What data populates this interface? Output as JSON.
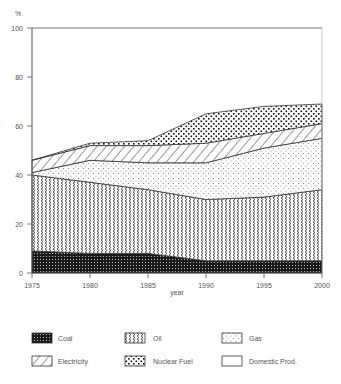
{
  "chart_data": {
    "type": "area",
    "stacked": true,
    "title": "",
    "xlabel": "year",
    "ylabel": "%",
    "x": [
      1975,
      1980,
      1985,
      1990,
      1995,
      2000
    ],
    "xlim": [
      1975,
      2000
    ],
    "ylim": [
      0,
      100
    ],
    "x_ticks": [
      "1975",
      "1980",
      "1985",
      "1990",
      "1995",
      "2000"
    ],
    "y_ticks": [
      "0",
      "20",
      "40",
      "60",
      "80",
      "100"
    ],
    "grid": false,
    "legend_position": "bottom",
    "series": [
      {
        "name": "Coal",
        "pattern": "dense-dots",
        "values": [
          9,
          8,
          8,
          5,
          5,
          5
        ]
      },
      {
        "name": "Oil",
        "pattern": "zigzag",
        "values": [
          31,
          29,
          26,
          25,
          26,
          29
        ]
      },
      {
        "name": "Gas",
        "pattern": "fine-dots",
        "values": [
          1,
          9,
          11,
          15,
          20,
          21
        ]
      },
      {
        "name": "Electricity",
        "pattern": "diagonal-hatch",
        "values": [
          5,
          6,
          7,
          8,
          6,
          6
        ]
      },
      {
        "name": "Nuclear Fuel",
        "pattern": "coarse-dots",
        "values": [
          0,
          1,
          2,
          12,
          11,
          8
        ]
      },
      {
        "name": "Domestic Prod.",
        "pattern": "blank",
        "values": [
          54,
          47,
          46,
          35,
          32,
          31
        ]
      }
    ]
  },
  "axis": {
    "y_unit": "%",
    "x_title": "year"
  },
  "legend": {
    "items": [
      {
        "label": "Coal"
      },
      {
        "label": "Oil"
      },
      {
        "label": "Gas"
      },
      {
        "label": "Electricity"
      },
      {
        "label": "Nuclear Fuel"
      },
      {
        "label": "Domestic Prod."
      }
    ]
  }
}
